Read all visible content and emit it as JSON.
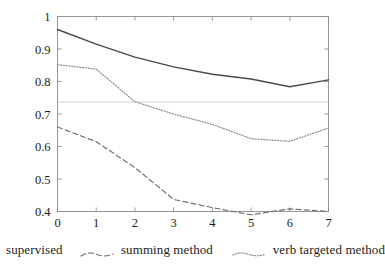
{
  "chart_data": {
    "type": "line",
    "title": "",
    "xlabel": "",
    "ylabel": "",
    "x": [
      0,
      1,
      2,
      3,
      4,
      5,
      6,
      7
    ],
    "xtick_labels": [
      "0",
      "1",
      "2",
      "3",
      "4",
      "5",
      "6",
      "7"
    ],
    "ytick_labels": [
      "1",
      "0.9",
      "0.8",
      "0.7",
      "0.6",
      "0.5",
      "0.4"
    ],
    "ytick_values": [
      1,
      0.9,
      0.8,
      0.7,
      0.6,
      0.5,
      0.4
    ],
    "xlim": [
      0,
      7
    ],
    "ylim": [
      0.4,
      1.0
    ],
    "grid": false,
    "reference_line": {
      "orientation": "horizontal",
      "value": 0.737,
      "color": "#cfcfd6"
    },
    "legend_position": "below",
    "series": [
      {
        "name": "supervised",
        "style": "solid",
        "color": "#4a4a4a",
        "values": [
          0.96,
          0.915,
          0.875,
          0.845,
          0.822,
          0.808,
          0.784,
          0.805
        ]
      },
      {
        "name": "summing method",
        "style": "dashed",
        "color": "#6f6f78",
        "values": [
          0.66,
          0.615,
          0.535,
          0.437,
          0.412,
          0.39,
          0.408,
          0.4
        ]
      },
      {
        "name": "verb targeted method",
        "style": "dotted",
        "color": "#8a8a92",
        "values": [
          0.852,
          0.838,
          0.738,
          0.7,
          0.668,
          0.624,
          0.616,
          0.657
        ]
      }
    ]
  },
  "legend": {
    "entries": [
      {
        "label": "supervised",
        "style": "solid"
      },
      {
        "label": "summing method",
        "style": "dashed"
      },
      {
        "label": "verb targeted method",
        "style": "dotted"
      }
    ]
  }
}
